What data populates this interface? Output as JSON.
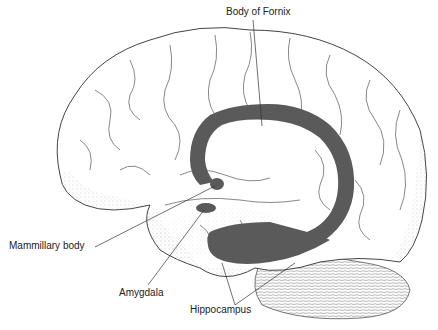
{
  "diagram": {
    "labels": {
      "fornix": "Body of Fornix",
      "mammillary": "Mammillary body",
      "amygdala": "Amygdala",
      "hippocampus": "Hippocampus"
    },
    "colors": {
      "highlight": "#5a5a5a",
      "outline": "#3a3a3a",
      "stipple": "#9a9a9a",
      "background": "#ffffff"
    }
  }
}
